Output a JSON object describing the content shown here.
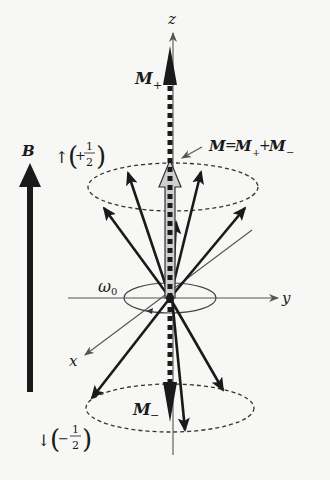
{
  "diagram": {
    "axes": {
      "z_label": "z",
      "y_label": "y",
      "x_label": "x"
    },
    "field": {
      "label": "B"
    },
    "spin_up": {
      "arrow": "↑",
      "value": "+",
      "num": "1",
      "den": "2",
      "paren_l": "(",
      "paren_r": ")"
    },
    "spin_down": {
      "arrow": "↓",
      "value": "−",
      "num": "1",
      "den": "2",
      "paren_l": "(",
      "paren_r": ")"
    },
    "labels": {
      "m_plus": "M",
      "m_plus_sub": "+",
      "m_minus": "M",
      "m_minus_sub": "−",
      "net_m": "M",
      "net_eq": "=",
      "net_m1": "M",
      "net_m1_sub": "+",
      "net_plus": "+",
      "net_m2": "M",
      "net_m2_sub": "−",
      "omega": "ω",
      "omega_sub": "0"
    },
    "colors": {
      "ink": "#1a1a1a",
      "axis": "#555555",
      "net_fill": "#cfcfcf",
      "background": "#f7f7f5"
    }
  }
}
